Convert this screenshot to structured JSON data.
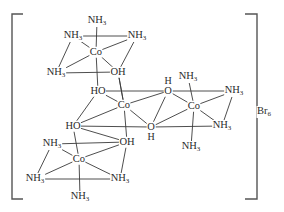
{
  "diagram": {
    "title": "",
    "counter_ion": {
      "symbol": "Br",
      "subscript": "6"
    },
    "colors": {
      "line": "#3a3a3a",
      "text": "#2a2a2a",
      "bracket": "#555555",
      "background": "#ffffff"
    },
    "nodes": [
      {
        "id": "co1",
        "text": "Co",
        "x": 96,
        "y": 52
      },
      {
        "id": "co1_nh3_top",
        "text": "NH",
        "sub": "3",
        "x": 97,
        "y": 21
      },
      {
        "id": "co1_nh3_ul",
        "text": "NH",
        "sub": "3",
        "x": 73,
        "y": 36
      },
      {
        "id": "co1_nh3_ur",
        "text": "NH",
        "sub": "3",
        "x": 137,
        "y": 36
      },
      {
        "id": "co1_nh3_ll",
        "text": "NH",
        "sub": "3",
        "x": 56,
        "y": 73
      },
      {
        "id": "co1_oh",
        "text": "OH",
        "x": 118,
        "y": 72
      },
      {
        "id": "co2",
        "text": "Co",
        "x": 124,
        "y": 105
      },
      {
        "id": "co2_ho_top",
        "text": "HO",
        "x": 98,
        "y": 91
      },
      {
        "id": "co2_ho_left",
        "text": "HO",
        "x": 73,
        "y": 126
      },
      {
        "id": "co2_o_top",
        "text": "O",
        "x": 168,
        "y": 91
      },
      {
        "id": "co2_o_bottom",
        "text": "O",
        "x": 151,
        "y": 127
      },
      {
        "id": "co3",
        "text": "Co",
        "x": 194,
        "y": 106
      },
      {
        "id": "co3_nh3_top",
        "text": "NH",
        "sub": "3",
        "x": 188,
        "y": 77
      },
      {
        "id": "co3_nh3_ur",
        "text": "NH",
        "sub": "3",
        "x": 234,
        "y": 91
      },
      {
        "id": "co3_nh3_lr",
        "text": "NH",
        "sub": "3",
        "x": 222,
        "y": 126
      },
      {
        "id": "co3_nh3_bottom",
        "text": "NH",
        "sub": "3",
        "x": 191,
        "y": 147
      },
      {
        "id": "co4",
        "text": "Co",
        "x": 79,
        "y": 159
      },
      {
        "id": "co4_nh3_ul",
        "text": "NH",
        "sub": "3",
        "x": 52,
        "y": 144
      },
      {
        "id": "co4_oh",
        "text": "OH",
        "x": 127,
        "y": 142
      },
      {
        "id": "co4_nh3_ll",
        "text": "NH",
        "sub": "3",
        "x": 35,
        "y": 179
      },
      {
        "id": "co4_nh3_lr",
        "text": "NH",
        "sub": "3",
        "x": 120,
        "y": 179
      },
      {
        "id": "co4_nh3_bottom",
        "text": "NH",
        "sub": "3",
        "x": 80,
        "y": 197
      }
    ],
    "h_labels": [
      {
        "id": "h_top",
        "text": "H",
        "x": 168,
        "y": 81
      },
      {
        "id": "h_bottom",
        "text": "H",
        "x": 151,
        "y": 137
      }
    ],
    "bonds": [
      [
        "co1",
        "co1_nh3_top"
      ],
      [
        "co1",
        "co1_nh3_ul"
      ],
      [
        "co1",
        "co1_nh3_ur"
      ],
      [
        "co1",
        "co1_nh3_ll"
      ],
      [
        "co1",
        "co1_oh"
      ],
      [
        "co1_nh3_ul",
        "co1_nh3_ur"
      ],
      [
        "co1_nh3_ul",
        "co1_nh3_ll"
      ],
      [
        "co1_nh3_ll",
        "co1_oh"
      ],
      [
        "co1_nh3_ur",
        "co1_oh"
      ],
      [
        "co1",
        "co2_ho_top"
      ],
      [
        "co1_oh",
        "co2"
      ],
      [
        "co2",
        "co2_ho_top"
      ],
      [
        "co2",
        "co2_ho_left"
      ],
      [
        "co2",
        "co2_o_top"
      ],
      [
        "co2",
        "co2_o_bottom"
      ],
      [
        "co2",
        "co4_oh"
      ],
      [
        "co2",
        "co1_oh"
      ],
      [
        "co2_ho_top",
        "co2_ho_left"
      ],
      [
        "co2_ho_top",
        "co2_o_top"
      ],
      [
        "co2_ho_left",
        "co2_o_bottom"
      ],
      [
        "co2_o_top",
        "co2_o_bottom"
      ],
      [
        "co3",
        "co3_nh3_top"
      ],
      [
        "co3",
        "co3_nh3_ur"
      ],
      [
        "co3",
        "co3_nh3_lr"
      ],
      [
        "co3",
        "co3_nh3_bottom"
      ],
      [
        "co3",
        "co2_o_top"
      ],
      [
        "co3",
        "co2_o_bottom"
      ],
      [
        "co2_o_top",
        "co3_nh3_ur"
      ],
      [
        "co2_o_bottom",
        "co3_nh3_lr"
      ],
      [
        "co3_nh3_ur",
        "co3_nh3_lr"
      ],
      [
        "co4",
        "co4_nh3_ul"
      ],
      [
        "co4",
        "co4_oh"
      ],
      [
        "co4",
        "co4_nh3_ll"
      ],
      [
        "co4",
        "co4_nh3_lr"
      ],
      [
        "co4",
        "co4_nh3_bottom"
      ],
      [
        "co4",
        "co2_ho_left"
      ],
      [
        "co4_nh3_ul",
        "co4_oh"
      ],
      [
        "co4_nh3_ul",
        "co4_nh3_ll"
      ],
      [
        "co4_nh3_ll",
        "co4_nh3_lr"
      ],
      [
        "co4_oh",
        "co4_nh3_lr"
      ],
      [
        "co2_ho_left",
        "co4_oh"
      ]
    ],
    "brackets": {
      "left": {
        "x": 12,
        "top": 14,
        "bottom": 199,
        "serif": 11
      },
      "right": {
        "x": 257,
        "top": 14,
        "bottom": 199,
        "serif": 12
      }
    }
  }
}
